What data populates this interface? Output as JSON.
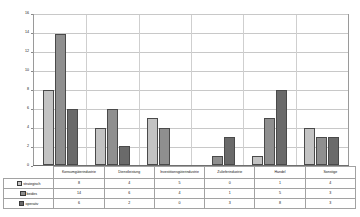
{
  "chart_data": {
    "type": "bar",
    "title": "",
    "xlabel": "",
    "ylabel": "",
    "ylim": [
      0,
      16
    ],
    "yticks": [
      0,
      2,
      4,
      6,
      8,
      10,
      12,
      14,
      16
    ],
    "grid": true,
    "legend_position": "table-left",
    "categories": [
      "Konsumgüterindustrie",
      "Dienstleistung",
      "Investitionsgüterindustrie",
      "Zulieferindustrie",
      "Handel",
      "Sonstige"
    ],
    "series": [
      {
        "name": "strategisch",
        "color": "#c3c3c3",
        "values": [
          8,
          4,
          5,
          0,
          1,
          4
        ]
      },
      {
        "name": "beides",
        "color": "#8f8f8f",
        "values": [
          14,
          6,
          4,
          1,
          5,
          3
        ]
      },
      {
        "name": "operativ",
        "color": "#6a6a6a",
        "values": [
          6,
          2,
          0,
          3,
          8,
          3
        ]
      }
    ]
  },
  "table": {
    "row_labels": [
      "strategisch",
      "beides",
      "operativ"
    ]
  }
}
